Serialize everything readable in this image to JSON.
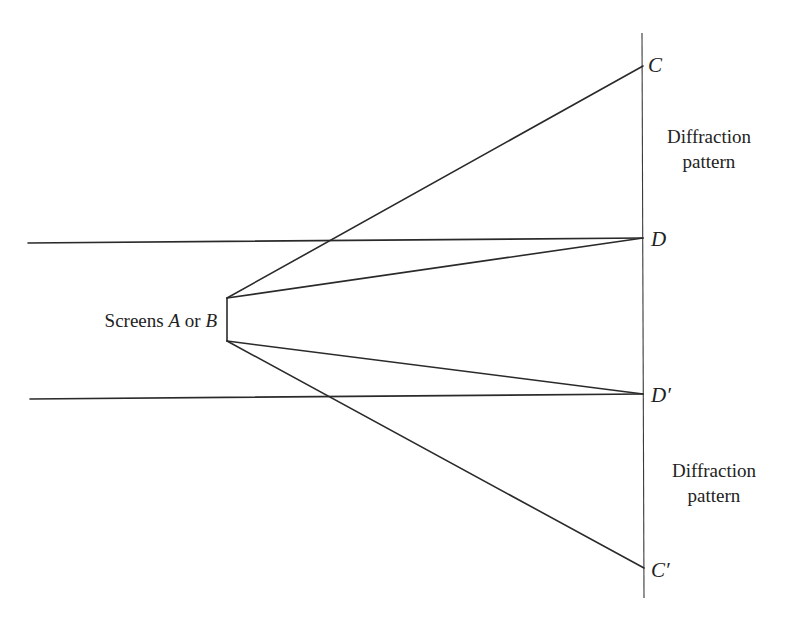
{
  "diagram": {
    "points": {
      "C": {
        "label": "C",
        "x": 643,
        "y": 66
      },
      "D": {
        "label": "D",
        "x": 643,
        "y": 238
      },
      "D_prime": {
        "label": "D′",
        "x": 643,
        "y": 394
      },
      "C_prime": {
        "label": "C′",
        "x": 644,
        "y": 568
      }
    },
    "screen_label": {
      "prefix": "Screens ",
      "a": "A",
      "or": " or ",
      "b": "B"
    },
    "pattern_labels": [
      {
        "line1": "Diffraction",
        "line2": "pattern"
      },
      {
        "line1": "Diffraction",
        "line2": "pattern"
      }
    ],
    "colors": {
      "line": "#2a2a2a",
      "text": "#222222",
      "background": "#ffffff"
    }
  }
}
